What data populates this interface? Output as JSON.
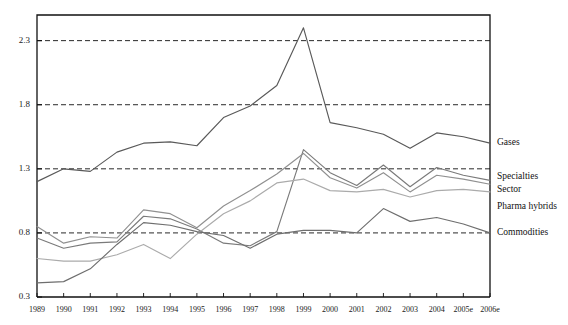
{
  "chart_data": {
    "type": "line",
    "title": "",
    "subtitle": "",
    "xlabel": "",
    "ylabel": "",
    "grid": true,
    "legend_position": "right-inline",
    "ylim": [
      0.3,
      2.5
    ],
    "yticks": [
      "0.3",
      "0.8",
      "1.3",
      "1.8",
      "2.3"
    ],
    "ytick_values": [
      0.3,
      0.8,
      1.3,
      1.8,
      2.3
    ],
    "categories": [
      "1989",
      "1990",
      "1991",
      "1992",
      "1993",
      "1994",
      "1995",
      "1996",
      "1997",
      "1998",
      "1999",
      "2000",
      "2001",
      "2002",
      "2003",
      "2004",
      "2005e",
      "2006e"
    ],
    "series": [
      {
        "name": "Gases",
        "color": "#595959",
        "values": [
          1.2,
          1.3,
          1.28,
          1.43,
          1.5,
          1.51,
          1.48,
          1.7,
          1.79,
          1.95,
          2.4,
          1.66,
          1.62,
          1.57,
          1.46,
          1.58,
          1.55,
          1.5
        ]
      },
      {
        "name": "Specialties",
        "color": "#7a7a7a",
        "values": [
          0.76,
          0.68,
          0.72,
          0.73,
          0.93,
          0.91,
          0.83,
          0.72,
          0.7,
          0.81,
          1.45,
          1.27,
          1.17,
          1.33,
          1.16,
          1.31,
          1.25,
          1.21
        ]
      },
      {
        "name": "Sector",
        "color": "#909090",
        "values": [
          0.85,
          0.72,
          0.77,
          0.76,
          0.98,
          0.95,
          0.84,
          1.01,
          1.13,
          1.26,
          1.42,
          1.23,
          1.15,
          1.27,
          1.12,
          1.25,
          1.22,
          1.18
        ]
      },
      {
        "name": "Pharma hybrids",
        "color": "#ababab",
        "values": [
          0.6,
          0.58,
          0.58,
          0.63,
          0.71,
          0.6,
          0.79,
          0.95,
          1.05,
          1.19,
          1.22,
          1.13,
          1.12,
          1.14,
          1.08,
          1.13,
          1.14,
          1.12
        ]
      },
      {
        "name": "Commodities",
        "color": "#6e6e6e",
        "values": [
          0.41,
          0.42,
          0.52,
          0.71,
          0.88,
          0.86,
          0.81,
          0.78,
          0.68,
          0.79,
          0.82,
          0.82,
          0.8,
          0.99,
          0.89,
          0.92,
          0.87,
          0.8
        ]
      }
    ]
  },
  "axis": {
    "ytick_labels": [
      "2.3",
      "1.8",
      "1.3",
      "0.8",
      "0.3"
    ],
    "xtick_labels": [
      "1989",
      "1990",
      "1991",
      "1992",
      "1993",
      "1994",
      "1995",
      "1996",
      "1997",
      "1998",
      "1999",
      "2000",
      "2001",
      "2002",
      "2003",
      "2004",
      "2005e",
      "2006e"
    ]
  },
  "legend": {
    "items": [
      {
        "label": "Gases"
      },
      {
        "label": "Specialties"
      },
      {
        "label": "Sector"
      },
      {
        "label": "Pharma hybrids"
      },
      {
        "label": "Commodities"
      }
    ]
  }
}
